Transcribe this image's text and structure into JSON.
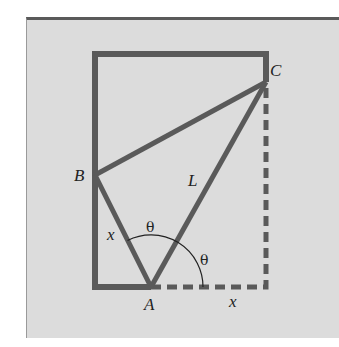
{
  "diagram": {
    "type": "geometry-figure",
    "labels": {
      "A": "A",
      "B": "B",
      "C": "C",
      "L": "L",
      "x_left": "x",
      "x_bottom": "x",
      "theta_top": "θ",
      "theta_right": "θ"
    },
    "colors": {
      "background": "#dcdcdc",
      "stroke": "#5a5a5a",
      "text": "#222222"
    },
    "points": {
      "A": [
        151,
        287
      ],
      "B": [
        95,
        175
      ],
      "C": [
        266,
        82
      ],
      "rect_top_left": [
        95,
        54
      ],
      "rect_bottom_right": [
        266,
        287
      ]
    }
  }
}
